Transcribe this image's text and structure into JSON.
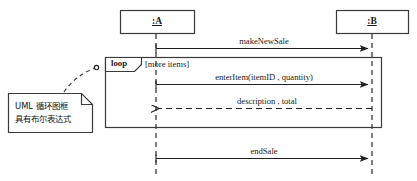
{
  "diagram": {
    "type": "uml-sequence-diagram",
    "stroke_color": "#3a3a3a",
    "text_color": "#1a1a1a",
    "background": "#ffffff"
  },
  "participants": [
    {
      "id": "a",
      "label": ":A",
      "box": {
        "x": 120,
        "y": 10,
        "w": 74,
        "h": 24
      },
      "lifeline_x": 156
    },
    {
      "id": "b",
      "label": ":B",
      "box": {
        "x": 336,
        "y": 10,
        "w": 72,
        "h": 24
      },
      "lifeline_x": 372
    }
  ],
  "fragment": {
    "operator": "loop",
    "guard": "[more items]",
    "box": {
      "x": 105,
      "y": 57,
      "w": 277,
      "h": 71
    }
  },
  "messages": [
    {
      "id": "m1",
      "label": "makeNewSale",
      "from": "a",
      "to": "b",
      "style": "solid",
      "y": 48
    },
    {
      "id": "m2",
      "label": "enterItem(itemID , quantity)",
      "from": "a",
      "to": "b",
      "style": "solid",
      "y": 84
    },
    {
      "id": "m3",
      "label": "description , total",
      "from": "b",
      "to": "a",
      "style": "dashed",
      "y": 108
    },
    {
      "id": "m4",
      "label": "endSale",
      "from": "a",
      "to": "b",
      "style": "solid",
      "y": 158
    }
  ],
  "note": {
    "lines": [
      "UML 循环图框",
      "具有布尔表达式"
    ],
    "box": {
      "x": 8,
      "y": 93,
      "w": 84,
      "h": 40
    },
    "fold": 11,
    "anchor_label": "note-anchor-circle"
  }
}
